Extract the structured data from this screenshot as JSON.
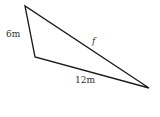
{
  "diagram": {
    "type": "triangle",
    "stroke_color": "#1a1a1a",
    "label_color": "#333333",
    "vertices": {
      "top": [
        25,
        6
      ],
      "bottom_left": [
        35,
        57
      ],
      "right": [
        149,
        88
      ]
    },
    "sides": {
      "left": {
        "label": "6m",
        "length": 6,
        "unit": "m"
      },
      "bottom": {
        "label": "12m",
        "length": 12,
        "unit": "m"
      },
      "hypotenuse": {
        "label": "f",
        "unknown": true
      }
    }
  }
}
